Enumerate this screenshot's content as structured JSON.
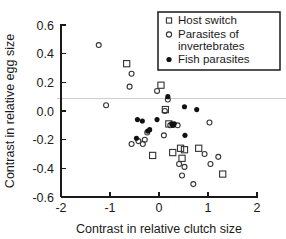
{
  "chart_data": {
    "type": "scatter",
    "title": "",
    "xlabel": "Contrast in relative clutch size",
    "ylabel": "Contrast in relative egg size",
    "xlim": [
      -2,
      2
    ],
    "ylim": [
      -0.6,
      0.6
    ],
    "xticks": [
      -2,
      -1,
      0,
      1,
      2
    ],
    "xticklabels": [
      "-2",
      "-1",
      "0",
      "1",
      "2"
    ],
    "yticks": [
      -0.6,
      -0.4,
      -0.2,
      0.0,
      0.2,
      0.4,
      0.6
    ],
    "yticklabels": [
      "-0.6",
      "-0.4",
      "-0.2",
      "0.0",
      "0.2",
      "0.4",
      "0.6"
    ],
    "grid": false,
    "reference_lines": [
      {
        "orientation": "horizontal",
        "value": 0.085,
        "color": "#c8c8c8"
      }
    ],
    "legend": {
      "position": "top-right",
      "border": true,
      "entries": [
        {
          "label": "Host switch",
          "marker": "open-square",
          "color": "#333333"
        },
        {
          "label": "Parasites of invertebrates",
          "marker": "open-circle",
          "color": "#333333"
        },
        {
          "label": "Fish parasites",
          "marker": "filled-circle",
          "color": "#111111"
        }
      ]
    },
    "series": [
      {
        "name": "Host switch",
        "marker": "open-square",
        "color": "#333333",
        "points": [
          [
            -0.66,
            0.33
          ],
          [
            0.04,
            0.18
          ],
          [
            0.13,
            0.01
          ],
          [
            0.2,
            -0.09
          ],
          [
            -0.13,
            -0.31
          ],
          [
            0.28,
            -0.29
          ],
          [
            0.44,
            -0.26
          ],
          [
            0.52,
            -0.27
          ],
          [
            0.47,
            -0.33
          ],
          [
            0.81,
            -0.26
          ],
          [
            1.3,
            -0.44
          ]
        ]
      },
      {
        "name": "Parasites of invertebrates",
        "marker": "open-circle",
        "color": "#333333",
        "points": [
          [
            -1.23,
            0.46
          ],
          [
            -0.56,
            0.26
          ],
          [
            -0.6,
            0.17
          ],
          [
            -1.08,
            0.04
          ],
          [
            -0.04,
            0.14
          ],
          [
            0.18,
            0.08
          ],
          [
            0.12,
            0.0
          ],
          [
            -0.56,
            -0.23
          ],
          [
            -0.42,
            -0.21
          ],
          [
            -0.29,
            -0.2
          ],
          [
            -0.33,
            -0.23
          ],
          [
            -0.24,
            -0.15
          ],
          [
            0.1,
            -0.17
          ],
          [
            0.23,
            -0.1
          ],
          [
            0.38,
            -0.1
          ],
          [
            1.03,
            -0.08
          ],
          [
            0.41,
            -0.37
          ],
          [
            0.52,
            -0.39
          ],
          [
            0.47,
            -0.45
          ],
          [
            0.7,
            -0.51
          ],
          [
            1.05,
            -0.37
          ],
          [
            1.21,
            -0.32
          ],
          [
            0.93,
            -0.3
          ]
        ]
      },
      {
        "name": "Fish parasites",
        "marker": "filled-circle",
        "color": "#111111",
        "points": [
          [
            0.18,
            0.1
          ],
          [
            0.52,
            0.03
          ],
          [
            0.77,
            0.01
          ],
          [
            -0.44,
            -0.06
          ],
          [
            -0.34,
            -0.07
          ],
          [
            -0.04,
            -0.06
          ],
          [
            0.26,
            -0.09
          ],
          [
            0.29,
            -0.1
          ],
          [
            0.31,
            -0.09
          ],
          [
            -0.23,
            -0.14
          ],
          [
            -0.19,
            -0.13
          ],
          [
            -0.46,
            -0.19
          ],
          [
            0.53,
            -0.17
          ]
        ]
      }
    ]
  },
  "axes": {
    "x_title": "Contrast in relative clutch size",
    "y_title": "Contrast in relative egg size"
  }
}
